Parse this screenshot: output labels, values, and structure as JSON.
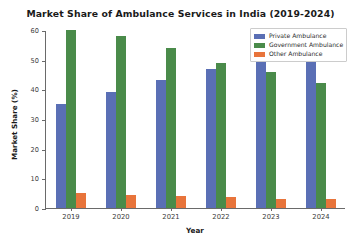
{
  "chart_data": {
    "type": "bar",
    "title": "Market Share of Ambulance Services in India (2019-2024)",
    "xlabel": "Year",
    "ylabel": "Market Share (%)",
    "categories": [
      "2019",
      "2020",
      "2021",
      "2022",
      "2023",
      "2024"
    ],
    "series": [
      {
        "name": "Private Ambulance",
        "color": "#5a6fb5",
        "values": [
          35,
          39,
          43,
          47,
          52,
          51
        ]
      },
      {
        "name": "Government Ambulance",
        "color": "#4a8b4a",
        "values": [
          60,
          58,
          54,
          49,
          46,
          42
        ]
      },
      {
        "name": "Other Ambulance",
        "color": "#e8743b",
        "values": [
          5,
          4.5,
          4,
          3.8,
          3.2,
          3
        ]
      }
    ],
    "ylim": [
      0,
      60
    ],
    "yticks": [
      0,
      10,
      20,
      30,
      40,
      50,
      60
    ],
    "ytick_labels": [
      "0",
      "10",
      "20",
      "30",
      "40",
      "50",
      "60"
    ],
    "grid": false,
    "legend_position": "upper right"
  },
  "legend": {
    "entries": [
      {
        "label": "Private Ambulance"
      },
      {
        "label": "Government Ambulance"
      },
      {
        "label": "Other Ambulance"
      }
    ]
  }
}
